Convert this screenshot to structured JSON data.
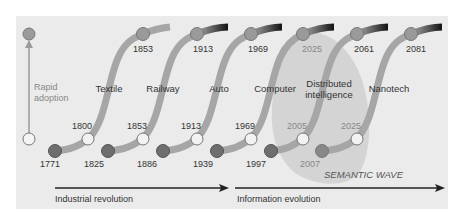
{
  "diagram": {
    "type": "technology-waves",
    "colors": {
      "panel_bg": "#ebebeb",
      "curve": "#a6a6a6",
      "curve_dark_end": "#1e1e1e",
      "start_circle": "#6e6e6e",
      "mid_circle": "#f2f2f2",
      "top_circle": "#9a9a9a",
      "semantic_blob": "#d4d4d4",
      "arrow": "#222222",
      "label": "#333333",
      "muted_label": "#888888"
    },
    "rapid_adoption": {
      "label_line1": "Rapid",
      "label_line2": "adoption"
    },
    "waves": [
      {
        "name": "Textile",
        "start": "1771",
        "mid": "1800",
        "top": "1853"
      },
      {
        "name": "Railway",
        "start": "1825",
        "mid": "1853",
        "top": "1913"
      },
      {
        "name": "Auto",
        "start": "1886",
        "mid": "1913",
        "top": "1969"
      },
      {
        "name": "Computer",
        "start": "1939",
        "mid": "1969",
        "top": "2025"
      },
      {
        "name_line1": "Distributed",
        "name_line2": "intelligence",
        "start": "1997",
        "mid": "2005",
        "top": "2061"
      },
      {
        "name": "Nanotech",
        "start": "2007",
        "mid": "2025",
        "top": "2081"
      }
    ],
    "semantic_wave_label": "SEMANTIC WAVE",
    "eras": [
      {
        "label": "Industrial revolution"
      },
      {
        "label": "Information evolution"
      }
    ]
  }
}
